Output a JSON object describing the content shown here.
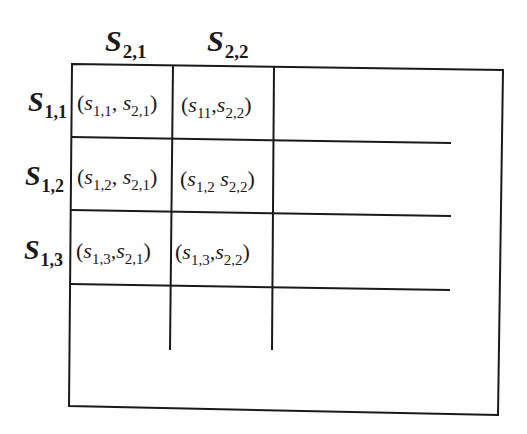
{
  "diagram": {
    "type": "game-payoff-matrix",
    "column_headers": [
      {
        "base": "S",
        "sub": "2,1"
      },
      {
        "base": "S",
        "sub": "2,2"
      }
    ],
    "row_headers": [
      {
        "base": "S",
        "sub": "1,1"
      },
      {
        "base": "S",
        "sub": "1,2"
      },
      {
        "base": "S",
        "sub": "1,3"
      }
    ],
    "cells": [
      [
        {
          "open": "(",
          "a_base": "s",
          "a_sub": "1,1",
          "sep": ",",
          "b_base": "s",
          "b_sub": "2,1",
          "close": ")"
        },
        {
          "open": "(",
          "a_base": "s",
          "a_sub": "11",
          "sep": ",",
          "b_base": "s",
          "b_sub": "2,2",
          "close": ")"
        }
      ],
      [
        {
          "open": "(",
          "a_base": "s",
          "a_sub": "1,2",
          "sep": ",",
          "b_base": "s",
          "b_sub": "2,1",
          "close": ")"
        },
        {
          "open": "(",
          "a_base": "s",
          "a_sub": "1,2",
          "sep": " ",
          "b_base": "s",
          "b_sub": "2,2",
          "close": ")"
        }
      ],
      [
        {
          "open": "(",
          "a_base": "s",
          "a_sub": "1,3",
          "sep": ",",
          "b_base": "s",
          "b_sub": "2,1",
          "close": ")"
        },
        {
          "open": "(",
          "a_base": "s",
          "a_sub": "1,3",
          "sep": ",",
          "b_base": "s",
          "b_sub": "2,2",
          "close": ")"
        }
      ]
    ],
    "colors": {
      "line": "#1a1a1a",
      "background": "#fefefe"
    }
  }
}
